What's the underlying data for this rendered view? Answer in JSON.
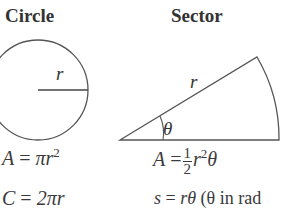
{
  "circle": {
    "title": "Circle",
    "radius_label": "r",
    "area_formula": {
      "lhs": "A",
      "rhs_prefix": "π",
      "rhs_var": "r",
      "exponent": "2"
    },
    "circumference_formula": {
      "lhs": "C",
      "rhs": "2πr"
    }
  },
  "sector": {
    "title": "Sector",
    "radius_label": "r",
    "angle_label": "θ",
    "area_formula": {
      "lhs": "A",
      "numerator": "1",
      "denominator": "2",
      "rhs_var": "r",
      "exponent": "2",
      "rhs_suffix": "θ"
    },
    "arc_formula": {
      "lhs": "s",
      "rhs": "rθ",
      "note": "(θ in rad"
    }
  }
}
